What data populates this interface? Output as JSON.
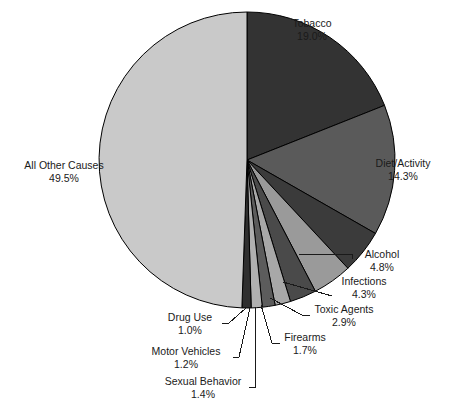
{
  "chart_data": {
    "type": "pie",
    "title": "",
    "subtitle": "",
    "xlabel": "",
    "ylabel": "",
    "grid": false,
    "legend_position": "callout-labels",
    "start_angle_deg": -90,
    "direction": "clockwise",
    "center": {
      "x": 247,
      "y": 160
    },
    "radius": 148,
    "categories": [
      "Tobacco",
      "Diet/Activity",
      "Alcohol",
      "Infections",
      "Toxic Agents",
      "Firearms",
      "Sexual Behavior",
      "Motor Vehicles",
      "Drug Use",
      "All Other Causes"
    ],
    "values": [
      19.0,
      14.3,
      4.8,
      4.3,
      2.9,
      1.7,
      1.4,
      1.2,
      1.0,
      49.5
    ],
    "value_labels": [
      "19.0%",
      "14.3%",
      "4.8%",
      "4.3%",
      "2.9%",
      "1.7%",
      "1.4%",
      "1.2%",
      "1.0%",
      "49.5%"
    ],
    "colors": [
      "#333333",
      "#5a5a5a",
      "#3b3b3b",
      "#9a9a9a",
      "#4a4a4a",
      "#a8a8a8",
      "#5c5c5c",
      "#b0b0b0",
      "#2f2f2f",
      "#c9c9c9"
    ],
    "slice_border_color": "#000000",
    "total": 100.0,
    "units": "percent"
  },
  "labels": {
    "tobacco": {
      "name": "Tobacco",
      "pct": "19.0%"
    },
    "diet_activity": {
      "name": "Diet/Activity",
      "pct": "14.3%"
    },
    "alcohol": {
      "name": "Alcohol",
      "pct": "4.8%"
    },
    "infections": {
      "name": "Infections",
      "pct": "4.3%"
    },
    "toxic_agents": {
      "name": "Toxic Agents",
      "pct": "2.9%"
    },
    "firearms": {
      "name": "Firearms",
      "pct": "1.7%"
    },
    "sexual_behavior": {
      "name": "Sexual Behavior",
      "pct": "1.4%"
    },
    "motor_vehicles": {
      "name": "Motor Vehicles",
      "pct": "1.2%"
    },
    "drug_use": {
      "name": "Drug Use",
      "pct": "1.0%"
    },
    "all_other_causes": {
      "name": "All Other Causes",
      "pct": "49.5%"
    }
  }
}
